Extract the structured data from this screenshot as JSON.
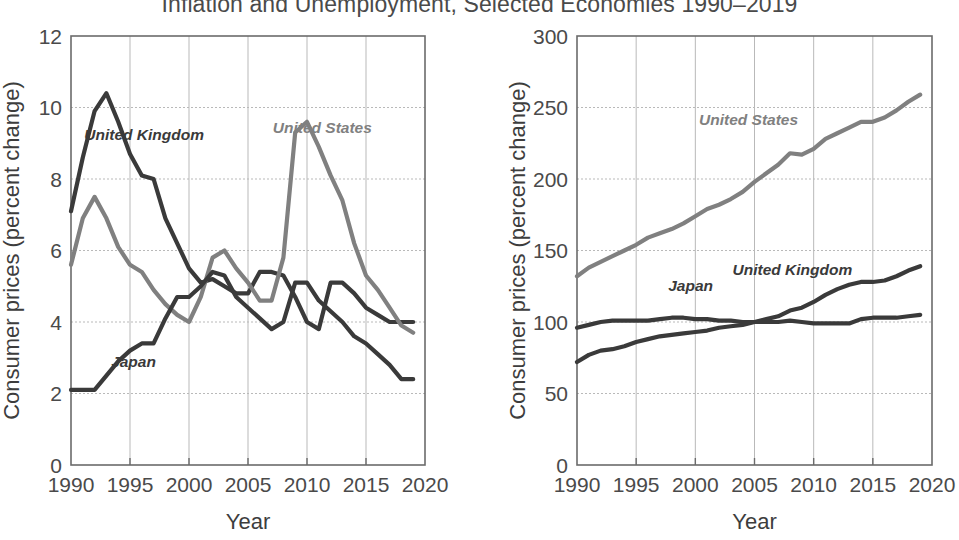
{
  "title": "Inflation and Unemployment, Selected Economies 1990–2019",
  "colors": {
    "dark_series": "#3a3a3a",
    "gray_series": "#808080",
    "axis": "#6b6b6b",
    "grid": "#b9b9b9",
    "text": "#3d3d3d",
    "background": "#ffffff"
  },
  "chart_data": [
    {
      "id": "left",
      "type": "line",
      "title": "",
      "xlabel": "Year",
      "ylabel": "Consumer prices (percent change)",
      "xlim": [
        1990,
        2020
      ],
      "ylim": [
        0,
        12
      ],
      "xticks": [
        1990,
        1995,
        2000,
        2005,
        2010,
        2015,
        2020
      ],
      "xtick_labels": [
        "1990",
        "1995",
        "2000",
        "2005",
        "2010",
        "2015",
        "2020"
      ],
      "yticks": [
        0,
        2,
        4,
        6,
        8,
        10,
        12
      ],
      "ytick_labels": [
        "0",
        "2",
        "4",
        "6",
        "8",
        "10",
        "12"
      ],
      "grid": true,
      "legend": "inline-annotations",
      "x": [
        1990,
        1991,
        1992,
        1993,
        1994,
        1995,
        1996,
        1997,
        1998,
        1999,
        2000,
        2001,
        2002,
        2003,
        2004,
        2005,
        2006,
        2007,
        2008,
        2009,
        2010,
        2011,
        2012,
        2013,
        2014,
        2015,
        2016,
        2017,
        2018,
        2019
      ],
      "series": [
        {
          "name": "United Kingdom",
          "color": "#3a3a3a",
          "label_x": 1996.2,
          "label_y": 9.1,
          "values": [
            7.1,
            8.6,
            9.9,
            10.4,
            9.6,
            8.7,
            8.1,
            8.0,
            6.9,
            6.2,
            5.5,
            5.1,
            5.2,
            5.0,
            4.8,
            4.8,
            5.4,
            5.4,
            5.3,
            4.7,
            4.0,
            3.8,
            5.1,
            5.1,
            4.8,
            4.4,
            4.2,
            4.0,
            4.0,
            4.0
          ]
        },
        {
          "name": "United States",
          "color": "#808080",
          "label_x": 2011.3,
          "label_y": 9.3,
          "values": [
            5.6,
            6.9,
            7.5,
            6.9,
            6.1,
            5.6,
            5.4,
            4.9,
            4.5,
            4.2,
            4.0,
            4.7,
            5.8,
            6.0,
            5.5,
            5.1,
            4.6,
            4.6,
            5.8,
            9.3,
            9.6,
            8.9,
            8.1,
            7.4,
            6.2,
            5.3,
            4.9,
            4.4,
            3.9,
            3.7
          ]
        },
        {
          "name": "Japan",
          "color": "#3a3a3a",
          "label_x": 1995.3,
          "label_y": 2.75,
          "values": [
            2.1,
            2.1,
            2.1,
            2.5,
            2.9,
            3.2,
            3.4,
            3.4,
            4.1,
            4.7,
            4.7,
            5.0,
            5.4,
            5.3,
            4.7,
            4.4,
            4.1,
            3.8,
            4.0,
            5.1,
            5.1,
            4.6,
            4.3,
            4.0,
            3.6,
            3.4,
            3.1,
            2.8,
            2.4,
            2.4
          ]
        }
      ]
    },
    {
      "id": "right",
      "type": "line",
      "title": "",
      "xlabel": "Year",
      "ylabel": "Consumer prices (percent change)",
      "xlim": [
        1990,
        2020
      ],
      "ylim": [
        0,
        300
      ],
      "xticks": [
        1990,
        1995,
        2000,
        2005,
        2010,
        2015,
        2020
      ],
      "xtick_labels": [
        "1990",
        "1995",
        "2000",
        "2005",
        "2010",
        "2015",
        "2020"
      ],
      "yticks": [
        0,
        50,
        100,
        150,
        200,
        250,
        300
      ],
      "ytick_labels": [
        "0",
        "50",
        "100",
        "150",
        "200",
        "250",
        "300"
      ],
      "grid": true,
      "legend": "inline-annotations",
      "x": [
        1990,
        1991,
        1992,
        1993,
        1994,
        1995,
        1996,
        1997,
        1998,
        1999,
        2000,
        2001,
        2002,
        2003,
        2004,
        2005,
        2006,
        2007,
        2008,
        2009,
        2010,
        2011,
        2012,
        2013,
        2014,
        2015,
        2016,
        2017,
        2018,
        2019
      ],
      "series": [
        {
          "name": "United States",
          "color": "#808080",
          "label_x": 2004.5,
          "label_y": 238,
          "values": [
            132,
            138,
            142,
            146,
            150,
            154,
            159,
            162,
            165,
            169,
            174,
            179,
            182,
            186,
            191,
            198,
            204,
            210,
            218,
            217,
            221,
            228,
            232,
            236,
            240,
            240,
            243,
            248,
            254,
            259
          ]
        },
        {
          "name": "United Kingdom",
          "color": "#3a3a3a",
          "label_x": 2008.2,
          "label_y": 133,
          "values": [
            72,
            77,
            80,
            81,
            83,
            86,
            88,
            90,
            91,
            92,
            93,
            94,
            96,
            97,
            98,
            100,
            102,
            104,
            108,
            110,
            114,
            119,
            123,
            126,
            128,
            128,
            129,
            132,
            136,
            139
          ]
        },
        {
          "name": "Japan",
          "color": "#3a3a3a",
          "label_x": 1999.6,
          "label_y": 122,
          "values": [
            96,
            98,
            100,
            101,
            101,
            101,
            101,
            102,
            103,
            103,
            102,
            102,
            101,
            101,
            100,
            100,
            100,
            100,
            101,
            100,
            99,
            99,
            99,
            99,
            102,
            103,
            103,
            103,
            104,
            105
          ]
        }
      ]
    }
  ]
}
